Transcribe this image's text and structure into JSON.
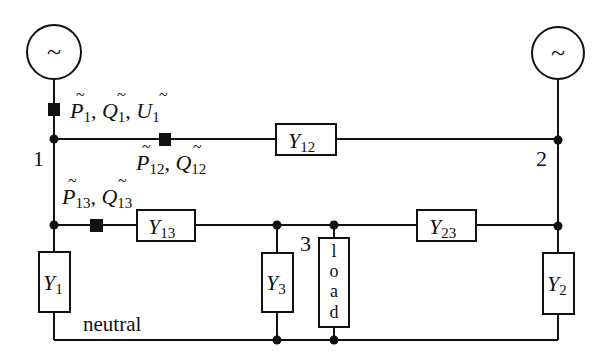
{
  "diagram": {
    "type": "power-network-circuit",
    "generators": [
      {
        "id": "gen-1",
        "symbol": "~",
        "bus": "1"
      },
      {
        "id": "gen-2",
        "symbol": "~",
        "bus": "2"
      }
    ],
    "buses": [
      {
        "id": "1",
        "label": "1"
      },
      {
        "id": "2",
        "label": "2"
      },
      {
        "id": "3",
        "label": "3"
      }
    ],
    "admittances": {
      "y12": {
        "base": "Y",
        "sub": "12"
      },
      "y13": {
        "base": "Y",
        "sub": "13"
      },
      "y23": {
        "base": "Y",
        "sub": "23"
      },
      "y1": {
        "base": "Y",
        "sub": "1"
      },
      "y2": {
        "base": "Y",
        "sub": "2"
      },
      "y3": {
        "base": "Y",
        "sub": "3"
      }
    },
    "load": {
      "label": "load",
      "letters": [
        "l",
        "o",
        "a",
        "d"
      ]
    },
    "neutral_label": "neutral",
    "measurements": {
      "m1": {
        "vars": [
          {
            "base": "P",
            "sub": "1"
          },
          {
            "base": "Q",
            "sub": "1"
          },
          {
            "base": "U",
            "sub": "1"
          }
        ],
        "sep": ", "
      },
      "m12": {
        "vars": [
          {
            "base": "P",
            "sub": "12"
          },
          {
            "base": "Q",
            "sub": "12"
          }
        ],
        "sep": ", "
      },
      "m13": {
        "vars": [
          {
            "base": "P",
            "sub": "13"
          },
          {
            "base": "Q",
            "sub": "13"
          }
        ],
        "sep": ", "
      }
    },
    "tilde": "~",
    "comma": ","
  }
}
